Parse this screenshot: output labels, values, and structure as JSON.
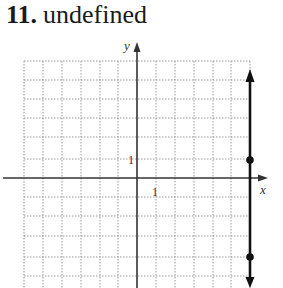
{
  "problem": {
    "number": "11.",
    "answer": "undefined"
  },
  "graph": {
    "x_axis_label": "x",
    "y_axis_label": "y",
    "x_tick_label": "1",
    "y_tick_label": "1",
    "grid": {
      "x_min": -6,
      "x_max": 6,
      "y_min": -5,
      "y_max": 6
    },
    "line": {
      "equation": "x = 6",
      "x": 6,
      "slope": "undefined",
      "color": "#111111"
    },
    "points": [
      {
        "x": 6,
        "y": 1
      },
      {
        "x": 6,
        "y": -4
      }
    ]
  }
}
